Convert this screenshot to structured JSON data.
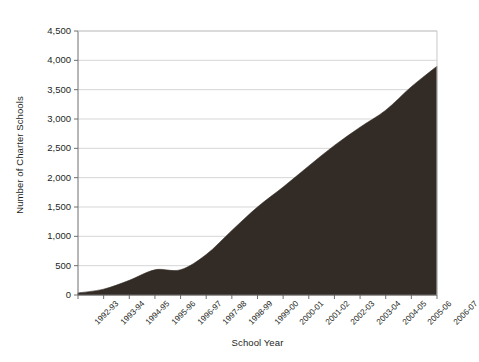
{
  "chart_data": {
    "type": "area",
    "title": "",
    "xlabel": "School Year",
    "ylabel": "Number of Charter Schools",
    "categories": [
      "1992-93",
      "1993-94",
      "1994-95",
      "1995-96",
      "1996-97",
      "1997-98",
      "1998-99",
      "1999-00",
      "2000-01",
      "2001-02",
      "2002-03",
      "2003-04",
      "2004-05",
      "2005-06",
      "2006-07"
    ],
    "values": [
      35,
      100,
      250,
      430,
      430,
      690,
      1100,
      1500,
      1840,
      2200,
      2550,
      2860,
      3150,
      3550,
      3900
    ],
    "ylim": [
      0,
      4500
    ],
    "ytick_labels": [
      "0",
      "500",
      "1,000",
      "1,500",
      "2,000",
      "2,500",
      "3,000",
      "3,500",
      "4,000",
      "4,500"
    ],
    "ytick_values": [
      0,
      500,
      1000,
      1500,
      2000,
      2500,
      3000,
      3500,
      4000,
      4500
    ],
    "grid": true,
    "legend": "none",
    "series_color": "#332b25",
    "grid_color": "#d6d6d6",
    "axis_color": "#6f6f6f",
    "text_color": "#231f1c"
  }
}
